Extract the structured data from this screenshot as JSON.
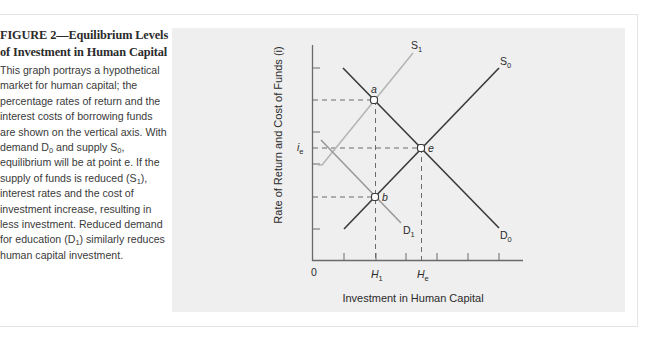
{
  "figure": {
    "title_line1": "FIGURE 2—Equilibrium Levels",
    "title_line2": "of Investment in Human Capital",
    "caption_parts": [
      "This graph portrays a hypothetical market for human capital; the percentage rates of return and the interest costs of borrowing funds are shown on the vertical axis. With demand D",
      "0",
      " and supply S",
      "0",
      ", equilibrium will be at point e. If the supply of funds is reduced (S",
      "1",
      "), interest rates and the cost of investment increase, resulting in less investment. Reduced demand for education (D",
      "1",
      ") similarly reduces human capital investment."
    ]
  },
  "chart_data": {
    "type": "line",
    "title": "Equilibrium Levels of Investment in Human Capital",
    "xlabel": "Investment in Human Capital",
    "ylabel": "Rate of Return and Cost of Funds (i)",
    "x_tick_labels": [
      {
        "label": "0",
        "sub": ""
      },
      {
        "label": "H",
        "sub": "1"
      },
      {
        "label": "H",
        "sub": "e"
      }
    ],
    "y_tick_labels": [
      {
        "label": "i",
        "sub": "e"
      }
    ],
    "grid": false,
    "series": [
      {
        "name": "S0",
        "label": "S",
        "sub": "0",
        "color": "#3a3a3a",
        "points": [
          [
            344,
            229
          ],
          [
            499,
            68
          ]
        ]
      },
      {
        "name": "S1",
        "label": "S",
        "sub": "1",
        "color": "#b5b5b5",
        "points": [
          [
            318,
            165
          ],
          [
            322,
            165
          ],
          [
            413,
            53
          ]
        ]
      },
      {
        "name": "D0",
        "label": "D",
        "sub": "0",
        "color": "#3a3a3a",
        "points": [
          [
            343,
            68
          ],
          [
            499,
            228
          ]
        ]
      },
      {
        "name": "D1",
        "label": "D",
        "sub": "1",
        "color": "#9a9a9a",
        "points": [
          [
            321,
            140
          ],
          [
            401,
            223
          ]
        ]
      }
    ],
    "points": [
      {
        "name": "a",
        "x": 374,
        "y": 100
      },
      {
        "name": "e",
        "x": 421,
        "y": 148
      },
      {
        "name": "b",
        "x": 375,
        "y": 197
      }
    ],
    "note": "Qualitative diagram: coordinates in pixel space; x-axis from 0 rightward, y-axis upward. Equilibrium e at (He, ie); a at higher rate with S1 and D0; b at lower rate with S0 and D1; both a and b at H1."
  },
  "axis": {
    "x_ticks": [
      344,
      376,
      406,
      437,
      468,
      499
    ],
    "y_ticks": [
      68,
      132,
      164,
      229
    ]
  }
}
